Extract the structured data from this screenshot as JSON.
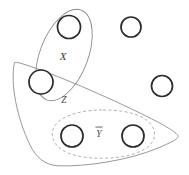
{
  "figure": {
    "kind": "set-venn-diagram",
    "background_color": "#ffffff",
    "width": 189,
    "height": 175
  },
  "labels": {
    "x": "X",
    "z": "Z",
    "y": "Y"
  },
  "regions": [
    {
      "id": "region-x",
      "label": "X",
      "style": "solid",
      "stroke_color": "#8c8c8c",
      "shape": "rotated-ellipse",
      "label_x": 63,
      "label_y": 57
    },
    {
      "id": "region-z",
      "label": "Z",
      "style": "solid",
      "stroke_color": "#8c8c8c",
      "shape": "curved-triangle",
      "label_x": 64,
      "label_y": 101
    },
    {
      "id": "region-y",
      "label": "Y",
      "style": "dashed",
      "stroke_color": "#a8a8a8",
      "shape": "rounded-ellipse",
      "label_x": 99,
      "label_y": 134
    }
  ],
  "nodes": [
    {
      "id": "node-1",
      "cx": 69,
      "cy": 27,
      "r": 11.5,
      "in_regions": [
        "X"
      ]
    },
    {
      "id": "node-2",
      "cx": 131,
      "cy": 27,
      "r": 10.0,
      "in_regions": []
    },
    {
      "id": "node-3",
      "cx": 41,
      "cy": 82,
      "r": 12.0,
      "in_regions": [
        "X",
        "Z"
      ]
    },
    {
      "id": "node-4",
      "cx": 162,
      "cy": 86,
      "r": 10.5,
      "in_regions": []
    },
    {
      "id": "node-5",
      "cx": 72,
      "cy": 136,
      "r": 11.0,
      "in_regions": [
        "Z",
        "Y"
      ]
    },
    {
      "id": "node-6",
      "cx": 133,
      "cy": 136,
      "r": 11.0,
      "in_regions": [
        "Z",
        "Y"
      ]
    }
  ],
  "colors": {
    "node_stroke": "#2b2b2b",
    "node_fill": "#ffffff",
    "region_solid": "#8c8c8c",
    "region_dashed": "#a8a8a8",
    "label_text": "#3a3a3a"
  }
}
